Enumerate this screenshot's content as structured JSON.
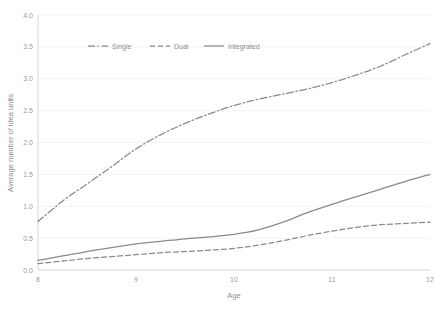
{
  "chart_data": {
    "type": "line",
    "title": "",
    "xlabel": "Age",
    "ylabel": "Average number of idea units",
    "xlim": [
      8,
      12
    ],
    "ylim": [
      0.0,
      4.0
    ],
    "xticks": [
      "8",
      "9",
      "10",
      "11",
      "12"
    ],
    "yticks": [
      "0.0",
      "0.5",
      "1.0",
      "1.5",
      "2.0",
      "2.5",
      "3.0",
      "3.5",
      "4.0"
    ],
    "ytick_values": [
      0.0,
      0.5,
      1.0,
      1.5,
      2.0,
      2.5,
      3.0,
      3.5,
      4.0
    ],
    "xtick_values": [
      8,
      9,
      10,
      11,
      12
    ],
    "grid": "horizontal-faint",
    "legend_position": "top-center-inside",
    "x": [
      8.0,
      8.25,
      8.5,
      8.75,
      9.0,
      9.25,
      9.5,
      9.75,
      10.0,
      10.25,
      10.5,
      10.75,
      11.0,
      11.25,
      11.5,
      11.75,
      12.0
    ],
    "series": [
      {
        "name": "Single",
        "style": "dash-dot",
        "color": "#8a8a8a",
        "values": [
          0.76,
          1.08,
          1.35,
          1.62,
          1.9,
          2.12,
          2.3,
          2.45,
          2.58,
          2.68,
          2.76,
          2.84,
          2.94,
          3.06,
          3.2,
          3.38,
          3.55
        ]
      },
      {
        "name": "Dual",
        "style": "dashed",
        "color": "#8a8a8a",
        "values": [
          0.1,
          0.14,
          0.18,
          0.21,
          0.24,
          0.27,
          0.29,
          0.31,
          0.34,
          0.39,
          0.46,
          0.54,
          0.61,
          0.67,
          0.71,
          0.73,
          0.75
        ]
      },
      {
        "name": "Integrated",
        "style": "solid",
        "color": "#8a8a8a",
        "values": [
          0.15,
          0.22,
          0.29,
          0.35,
          0.41,
          0.45,
          0.49,
          0.52,
          0.56,
          0.63,
          0.75,
          0.9,
          1.03,
          1.15,
          1.27,
          1.39,
          1.5
        ]
      }
    ]
  },
  "legend": {
    "items": [
      {
        "label": "Single"
      },
      {
        "label": "Dual"
      },
      {
        "label": "Integrated"
      }
    ]
  }
}
